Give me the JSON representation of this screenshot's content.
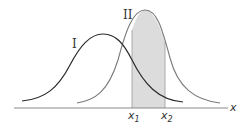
{
  "diagram": {
    "type": "overlapping normal distribution curves with shaded interval",
    "curves": [
      {
        "label": "I",
        "color": "#2a2a2a",
        "peak_x": 103,
        "peak_y": 34
      },
      {
        "label": "II",
        "color": "#7a7a7a",
        "peak_x": 145,
        "peak_y": 10
      }
    ],
    "axis": {
      "label": "x"
    },
    "interval": {
      "lower_label": "x",
      "lower_sub": "1",
      "upper_label": "x",
      "upper_sub": "2",
      "shade_color": "#dcdcdc"
    }
  }
}
